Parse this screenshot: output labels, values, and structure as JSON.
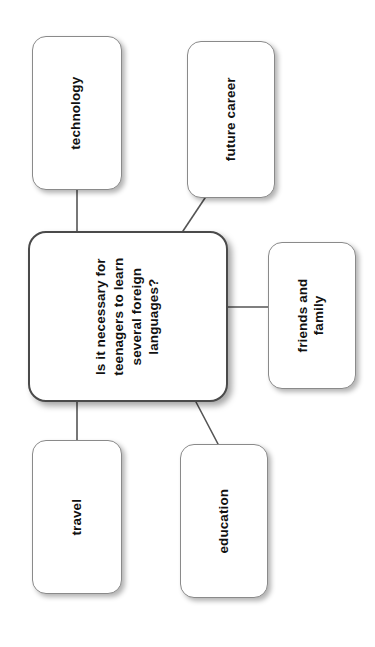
{
  "diagram": {
    "type": "mind-map",
    "orientation": "rotated-90-ccw",
    "canvas": {
      "width": 375,
      "height": 647,
      "background": "#ffffff"
    },
    "central_node": {
      "id": "central",
      "label": "Is it necessary for\nteenagers to learn\nseveral foreign\nlanguages?",
      "label_plain": "Is it necessary for teenagers to learn several foreign languages?"
    },
    "branches": [
      {
        "id": "technology",
        "label": "technology"
      },
      {
        "id": "future-career",
        "label": "future career"
      },
      {
        "id": "friends-family",
        "label": "friends and\nfamily",
        "label_plain": "friends and family"
      },
      {
        "id": "travel",
        "label": "travel"
      },
      {
        "id": "education",
        "label": "education"
      }
    ],
    "connectors": [
      {
        "from": "central",
        "to": "technology",
        "style": "straight"
      },
      {
        "from": "central",
        "to": "future-career",
        "style": "diagonal"
      },
      {
        "from": "central",
        "to": "friends-family",
        "style": "straight"
      },
      {
        "from": "central",
        "to": "travel",
        "style": "straight"
      },
      {
        "from": "central",
        "to": "education",
        "style": "diagonal"
      }
    ],
    "style": {
      "node_fill": "#ffffff",
      "node_border": "#8a8a8a",
      "central_border": "#4a4a4a",
      "text_color": "#111111",
      "connector_color": "#555555",
      "shadow_color": "rgba(0,0,0,0.30)"
    }
  }
}
